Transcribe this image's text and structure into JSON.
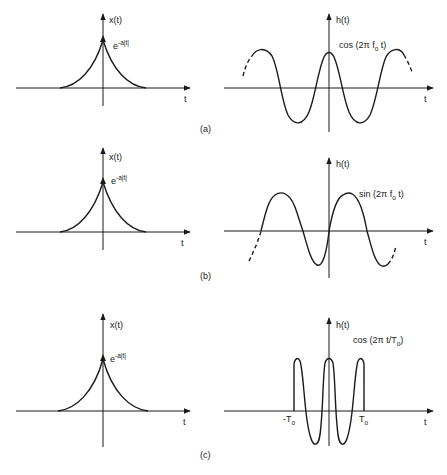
{
  "figure": {
    "panels": [
      {
        "id": "a",
        "caption": "(a)",
        "left": {
          "y_label": "x(t)",
          "x_label": "t",
          "curve_label_base": "e",
          "curve_label_exp": "-a|t|"
        },
        "right": {
          "y_label": "h(t)",
          "x_label": "t",
          "curve_label": "cos (2π f",
          "curve_label_sub": "o",
          "curve_label_tail": " t)"
        }
      },
      {
        "id": "b",
        "caption": "(b)",
        "left": {
          "y_label": "x(t)",
          "x_label": "t",
          "curve_label_base": "e",
          "curve_label_exp": "-a|t|"
        },
        "right": {
          "y_label": "h(t)",
          "x_label": "t",
          "curve_label": "sin (2π f",
          "curve_label_sub": "o",
          "curve_label_tail": " t)"
        }
      },
      {
        "id": "c",
        "caption": "(c)",
        "left": {
          "y_label": "x(t)",
          "x_label": "t",
          "curve_label_base": "e",
          "curve_label_exp": "-a|t|"
        },
        "right": {
          "y_label": "h(t)",
          "x_label": "t",
          "curve_label": "cos (2π t/T",
          "curve_label_sub": "o",
          "curve_label_tail": ")",
          "tick_neg": "-T",
          "tick_neg_sub": "o",
          "tick_pos": "T",
          "tick_pos_sub": "o"
        }
      }
    ]
  }
}
